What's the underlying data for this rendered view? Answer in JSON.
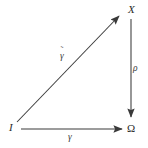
{
  "diagram": {
    "type": "commutative-diagram",
    "canvas": {
      "width": 148,
      "height": 148,
      "background": "#ffffff"
    },
    "stroke_color": "#3a3a3a",
    "text_color": "#2b2b2b",
    "nodes": [
      {
        "id": "I",
        "label": "I",
        "position": "bottom-left"
      },
      {
        "id": "X",
        "label": "X",
        "position": "top-right"
      },
      {
        "id": "Omega",
        "label": "Ω",
        "position": "bottom-right"
      }
    ],
    "edges": [
      {
        "id": "diagonal",
        "from": "I",
        "to": "X",
        "label": "γ",
        "accent": "˜",
        "direction": "up-right",
        "arrowhead": "end"
      },
      {
        "id": "vertical",
        "from": "X",
        "to": "Omega",
        "label": "ρ",
        "accent": "",
        "direction": "down",
        "arrowhead": "end"
      },
      {
        "id": "horizontal",
        "from": "I",
        "to": "Omega",
        "label": "γ",
        "accent": "",
        "direction": "right",
        "arrowhead": "end"
      }
    ]
  }
}
